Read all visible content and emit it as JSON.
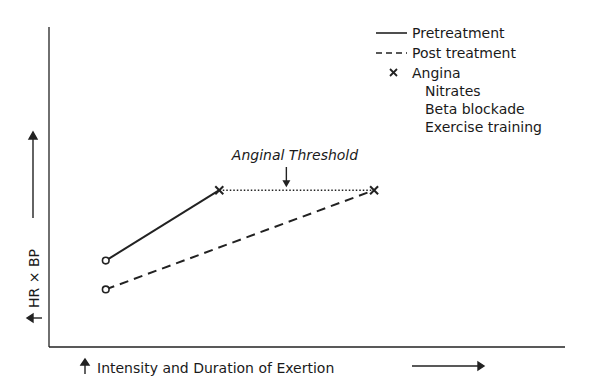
{
  "chart_data": {
    "type": "line",
    "title": "",
    "xlabel": "Intensity and Duration of Exertion",
    "ylabel": "HR × BP",
    "xlim": [
      0,
      10
    ],
    "ylim": [
      0,
      10
    ],
    "grid": false,
    "series": [
      {
        "name": "Pretreatment",
        "style": "solid",
        "points": [
          [
            1.1,
            2.7
          ],
          [
            3.3,
            4.9
          ]
        ],
        "start_marker": "circle",
        "end_marker": "x"
      },
      {
        "name": "Post treatment",
        "style": "dashed",
        "points": [
          [
            1.1,
            1.8
          ],
          [
            6.3,
            4.9
          ]
        ],
        "start_marker": "circle",
        "end_marker": "x"
      },
      {
        "name": "Anginal Threshold",
        "style": "dotted",
        "points": [
          [
            3.3,
            4.9
          ],
          [
            6.3,
            4.9
          ]
        ]
      }
    ],
    "annotations": [
      {
        "text": "Anginal Threshold",
        "points_to": [
          4.6,
          4.9
        ],
        "arrow": "down"
      }
    ],
    "legend": {
      "placement": "top-right",
      "entries": [
        {
          "symbol": "solid-line",
          "label": "Pretreatment"
        },
        {
          "symbol": "dashed-line",
          "label": "Post treatment"
        },
        {
          "symbol": "x-marker",
          "label": "Angina"
        }
      ],
      "notes": [
        "Nitrates",
        "Beta blockade",
        "Exercise training"
      ]
    }
  }
}
